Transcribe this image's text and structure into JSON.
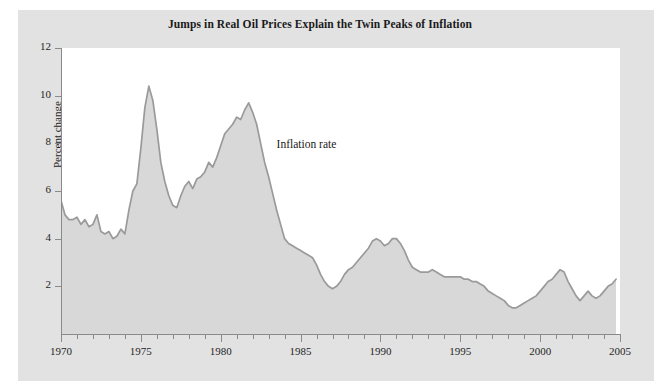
{
  "figure": {
    "panel_color": "#e2e2e2",
    "plot_bg_color": "#ffffff",
    "axis_color": "#8a8a8a"
  },
  "title": "Jumps in Real Oil Prices Explain the Twin Peaks of Inflation",
  "annotation": "Inflation rate",
  "chart_data": {
    "type": "area",
    "title": "Jumps in Real Oil Prices Explain the Twin Peaks of Inflation",
    "xlabel": "",
    "ylabel": "Percent change",
    "xlim": [
      1970,
      2005
    ],
    "ylim": [
      0,
      12
    ],
    "ytick_labels": [
      "12",
      "10",
      "8",
      "6",
      "4",
      "2"
    ],
    "yticks": [
      12,
      10,
      8,
      6,
      4,
      2
    ],
    "xtick_labels": [
      "1970",
      "1975",
      "1980",
      "1985",
      "1990",
      "1995",
      "2000",
      "2005"
    ],
    "xticks": [
      1970,
      1975,
      1980,
      1985,
      1990,
      1995,
      2000,
      2005
    ],
    "minor_xtick_interval": 1,
    "grid": false,
    "legend": "none",
    "annotations": [
      {
        "text": "Inflation rate",
        "x": 1983.5,
        "y": 7.9
      }
    ],
    "series": [
      {
        "name": "Inflation rate",
        "line_color": "#9a9a9a",
        "fill_color": "#d8d8d8",
        "x": [
          1970.0,
          1970.25,
          1970.5,
          1970.75,
          1971.0,
          1971.25,
          1971.5,
          1971.75,
          1972.0,
          1972.25,
          1972.5,
          1972.75,
          1973.0,
          1973.25,
          1973.5,
          1973.75,
          1974.0,
          1974.25,
          1974.5,
          1974.75,
          1975.0,
          1975.25,
          1975.5,
          1975.75,
          1976.0,
          1976.25,
          1976.5,
          1976.75,
          1977.0,
          1977.25,
          1977.5,
          1977.75,
          1978.0,
          1978.25,
          1978.5,
          1978.75,
          1979.0,
          1979.25,
          1979.5,
          1979.75,
          1980.0,
          1980.25,
          1980.5,
          1980.75,
          1981.0,
          1981.25,
          1981.5,
          1981.75,
          1982.0,
          1982.25,
          1982.5,
          1982.75,
          1983.0,
          1983.25,
          1983.5,
          1983.75,
          1984.0,
          1984.25,
          1984.5,
          1984.75,
          1985.0,
          1985.25,
          1985.5,
          1985.75,
          1986.0,
          1986.25,
          1986.5,
          1986.75,
          1987.0,
          1987.25,
          1987.5,
          1987.75,
          1988.0,
          1988.25,
          1988.5,
          1988.75,
          1989.0,
          1989.25,
          1989.5,
          1989.75,
          1990.0,
          1990.25,
          1990.5,
          1990.75,
          1991.0,
          1991.25,
          1991.5,
          1991.75,
          1992.0,
          1992.25,
          1992.5,
          1992.75,
          1993.0,
          1993.25,
          1993.5,
          1993.75,
          1994.0,
          1994.25,
          1994.5,
          1994.75,
          1995.0,
          1995.25,
          1995.5,
          1995.75,
          1996.0,
          1996.25,
          1996.5,
          1996.75,
          1997.0,
          1997.25,
          1997.5,
          1997.75,
          1998.0,
          1998.25,
          1998.5,
          1998.75,
          1999.0,
          1999.25,
          1999.5,
          1999.75,
          2000.0,
          2000.25,
          2000.5,
          2000.75,
          2001.0,
          2001.25,
          2001.5,
          2001.75,
          2002.0,
          2002.25,
          2002.5,
          2002.75,
          2003.0,
          2003.25,
          2003.5,
          2003.75,
          2004.0,
          2004.25,
          2004.5,
          2004.75
        ],
        "y": [
          5.6,
          5.0,
          4.8,
          4.8,
          4.9,
          4.6,
          4.8,
          4.5,
          4.6,
          5.0,
          4.3,
          4.2,
          4.3,
          4.0,
          4.1,
          4.4,
          4.2,
          5.2,
          6.0,
          6.3,
          7.8,
          9.5,
          10.4,
          9.8,
          8.6,
          7.2,
          6.4,
          5.8,
          5.4,
          5.3,
          5.8,
          6.2,
          6.4,
          6.1,
          6.5,
          6.6,
          6.8,
          7.2,
          7.0,
          7.4,
          7.9,
          8.4,
          8.6,
          8.8,
          9.1,
          9.0,
          9.4,
          9.7,
          9.3,
          8.8,
          8.0,
          7.2,
          6.6,
          5.9,
          5.2,
          4.6,
          4.0,
          3.8,
          3.7,
          3.6,
          3.5,
          3.4,
          3.3,
          3.2,
          2.9,
          2.5,
          2.2,
          2.0,
          1.9,
          2.0,
          2.2,
          2.5,
          2.7,
          2.8,
          3.0,
          3.2,
          3.4,
          3.6,
          3.9,
          4.0,
          3.9,
          3.7,
          3.8,
          4.0,
          4.0,
          3.8,
          3.5,
          3.1,
          2.8,
          2.7,
          2.6,
          2.6,
          2.6,
          2.7,
          2.6,
          2.5,
          2.4,
          2.4,
          2.4,
          2.4,
          2.4,
          2.3,
          2.3,
          2.2,
          2.2,
          2.1,
          2.0,
          1.8,
          1.7,
          1.6,
          1.5,
          1.4,
          1.2,
          1.1,
          1.1,
          1.2,
          1.3,
          1.4,
          1.5,
          1.6,
          1.8,
          2.0,
          2.2,
          2.3,
          2.5,
          2.7,
          2.6,
          2.2,
          1.9,
          1.6,
          1.4,
          1.6,
          1.8,
          1.6,
          1.5,
          1.6,
          1.8,
          2.0,
          2.1,
          2.3
        ]
      }
    ]
  }
}
